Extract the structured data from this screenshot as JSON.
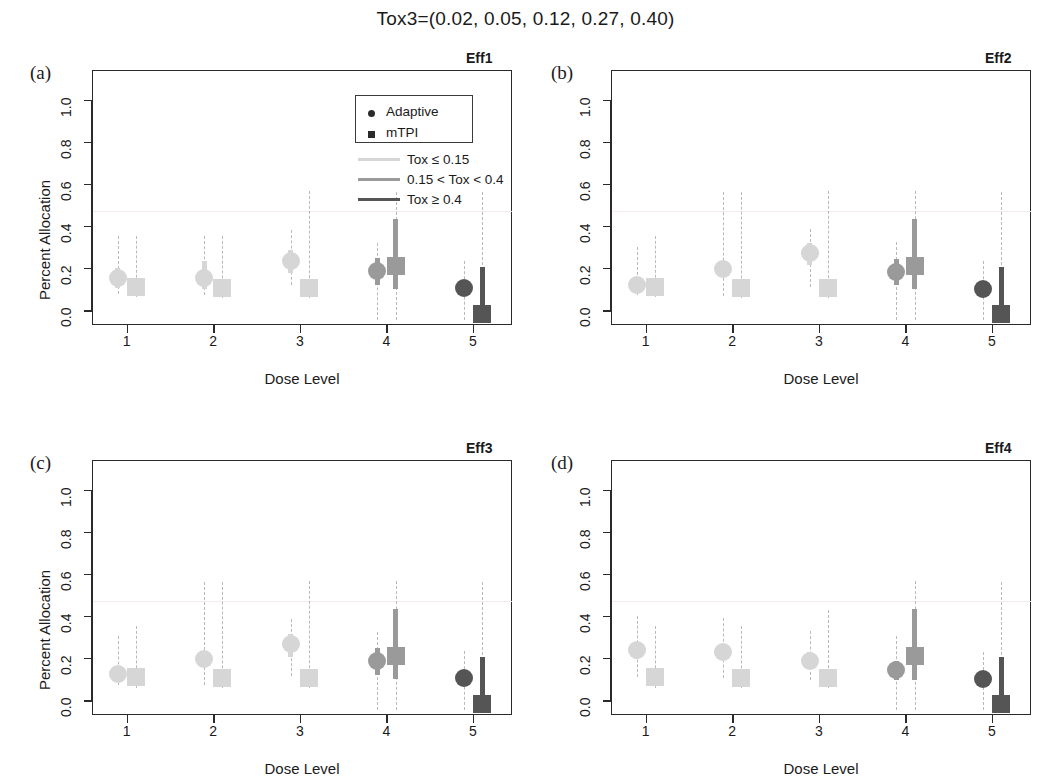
{
  "figure": {
    "title": "Tox3=(0.02, 0.05, 0.12, 0.27, 0.40)",
    "xlabel": "Dose Level",
    "ylabel": "Percent Allocation",
    "ytick_labels": [
      "0.0",
      "0.2",
      "0.4",
      "0.6",
      "0.8",
      "1.0"
    ],
    "xtick_labels": [
      "1",
      "2",
      "3",
      "4",
      "5"
    ]
  },
  "legend": {
    "method_entries": [
      {
        "label": "Adaptive",
        "marker": "circle-marker"
      },
      {
        "label": "mTPI",
        "marker": "square-marker"
      }
    ],
    "tox_entries": [
      {
        "label": "Tox ≤ 0.15",
        "color": "#d6d6d6"
      },
      {
        "label": "0.15 < Tox < 0.4",
        "color": "#9a9a9a"
      },
      {
        "label": "Tox ≥ 0.4",
        "color": "#555555"
      }
    ]
  },
  "colors": {
    "tox_low": "#d6d6d6",
    "tox_mid": "#9a9a9a",
    "tox_high": "#555555",
    "axis": "#2a2a2a",
    "dashed": "#b9b9b9",
    "hairline": "#f2e9ea"
  },
  "chart_data": {
    "type": "scatter",
    "title": "Tox3=(0.02, 0.05, 0.12, 0.27, 0.40)",
    "xlabel": "Dose Level",
    "ylabel": "Percent Allocation",
    "xlim": [
      0.6,
      5.45
    ],
    "ylim": [
      -0.07,
      1.14
    ],
    "ytick_values": [
      0.0,
      0.2,
      0.4,
      0.6,
      0.8,
      1.0
    ],
    "xtick_values": [
      1,
      2,
      3,
      4,
      5
    ],
    "grid": false,
    "legend_position": "top-center-of-panel-a",
    "tox_probabilities": [
      0.02,
      0.05,
      0.12,
      0.27,
      0.4
    ],
    "tox_bands": [
      "low",
      "low",
      "low",
      "mid",
      "high"
    ],
    "series_names": [
      "Adaptive",
      "mTPI"
    ],
    "panels": [
      {
        "tag": "(a)",
        "eff_label": "Eff1",
        "adaptive": {
          "median": [
            0.155,
            0.155,
            0.232,
            0.185,
            0.105
          ],
          "inner_low": [
            0.105,
            0.1,
            0.175,
            0.118,
            0.082
          ],
          "inner_high": [
            0.2,
            0.235,
            0.288,
            0.25,
            0.128
          ],
          "outer_low": [
            0.075,
            0.072,
            0.118,
            -0.045,
            -0.045
          ],
          "outer_high": [
            0.35,
            0.352,
            0.38,
            0.32,
            0.235
          ]
        },
        "mtpi": {
          "median": [
            0.108,
            0.105,
            0.105,
            0.208,
            -0.02
          ],
          "inner_low": [
            0.085,
            0.085,
            0.085,
            0.1,
            -0.045
          ],
          "inner_high": [
            0.13,
            0.128,
            0.128,
            0.432,
            0.205
          ],
          "outer_low": [
            0.062,
            0.06,
            0.06,
            -0.045,
            -0.045
          ],
          "outer_high": [
            0.352,
            0.352,
            0.565,
            0.56,
            0.56
          ]
        }
      },
      {
        "tag": "(b)",
        "eff_label": "Eff2",
        "adaptive": {
          "median": [
            0.12,
            0.195,
            0.272,
            0.182,
            0.1
          ],
          "inner_low": [
            0.098,
            0.16,
            0.215,
            0.12,
            0.078
          ],
          "inner_high": [
            0.145,
            0.228,
            0.318,
            0.243,
            0.122
          ],
          "outer_low": [
            0.07,
            0.068,
            0.112,
            -0.045,
            -0.045
          ],
          "outer_high": [
            0.3,
            0.56,
            0.385,
            0.322,
            0.232
          ]
        },
        "mtpi": {
          "median": [
            0.108,
            0.105,
            0.105,
            0.208,
            -0.02
          ],
          "inner_low": [
            0.085,
            0.085,
            0.085,
            0.1,
            -0.045
          ],
          "inner_high": [
            0.13,
            0.128,
            0.128,
            0.432,
            0.205
          ],
          "outer_low": [
            0.062,
            0.06,
            0.06,
            -0.045,
            -0.045
          ],
          "outer_high": [
            0.35,
            0.56,
            0.565,
            0.565,
            0.56
          ]
        }
      },
      {
        "tag": "(c)",
        "eff_label": "Eff3",
        "adaptive": {
          "median": [
            0.125,
            0.198,
            0.268,
            0.188,
            0.105
          ],
          "inner_low": [
            0.1,
            0.165,
            0.205,
            0.118,
            0.082
          ],
          "inner_high": [
            0.148,
            0.23,
            0.312,
            0.25,
            0.128
          ],
          "outer_low": [
            0.072,
            0.07,
            0.115,
            -0.045,
            -0.045
          ],
          "outer_high": [
            0.305,
            0.56,
            0.385,
            0.322,
            0.235
          ]
        },
        "mtpi": {
          "median": [
            0.108,
            0.105,
            0.105,
            0.208,
            -0.02
          ],
          "inner_low": [
            0.085,
            0.085,
            0.085,
            0.1,
            -0.045
          ],
          "inner_high": [
            0.13,
            0.128,
            0.128,
            0.432,
            0.205
          ],
          "outer_low": [
            0.06,
            0.06,
            0.06,
            -0.045,
            -0.045
          ],
          "outer_high": [
            0.352,
            0.56,
            0.565,
            0.565,
            0.56
          ]
        }
      },
      {
        "tag": "(d)",
        "eff_label": "Eff4",
        "adaptive": {
          "median": [
            0.238,
            0.23,
            0.188,
            0.142,
            0.1
          ],
          "inner_low": [
            0.198,
            0.192,
            0.152,
            0.098,
            0.078
          ],
          "inner_high": [
            0.278,
            0.268,
            0.228,
            0.185,
            0.122
          ],
          "outer_low": [
            0.11,
            0.105,
            0.098,
            -0.045,
            -0.045
          ],
          "outer_high": [
            0.398,
            0.392,
            0.33,
            0.305,
            0.228
          ]
        },
        "mtpi": {
          "median": [
            0.108,
            0.105,
            0.105,
            0.208,
            -0.02
          ],
          "inner_low": [
            0.085,
            0.085,
            0.085,
            0.098,
            -0.045
          ],
          "inner_high": [
            0.13,
            0.128,
            0.128,
            0.432,
            0.205
          ],
          "outer_low": [
            0.06,
            0.06,
            0.06,
            -0.045,
            -0.045
          ],
          "outer_high": [
            0.352,
            0.352,
            0.43,
            0.565,
            0.56
          ]
        }
      }
    ]
  }
}
